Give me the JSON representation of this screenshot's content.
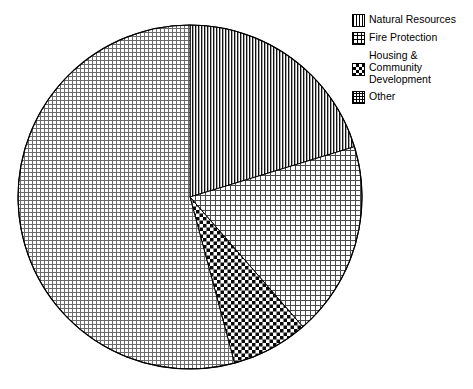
{
  "chart_data": {
    "type": "pie",
    "title": "",
    "labels": [
      "Natural Resources",
      "Fire Protection",
      "Housing & Community Development",
      "Other"
    ],
    "values": [
      20.3,
      18.3,
      7.1,
      54.3
    ],
    "units": "percent",
    "start_angle_deg": 0,
    "direction": "clockwise",
    "legend_position": "top-right",
    "grid": false,
    "slices": [
      {
        "label": "Natural Resources",
        "value": 20.3,
        "start_angle_deg": 0,
        "end_angle_deg": 73,
        "pattern": "vertical-stripes",
        "color": "#000000",
        "background": "#ffffff"
      },
      {
        "label": "Fire Protection",
        "value": 18.3,
        "start_angle_deg": 73,
        "end_angle_deg": 139,
        "pattern": "grid-coarse",
        "color": "#000000",
        "background": "#ffffff"
      },
      {
        "label": "Housing & Community Development",
        "value": 7.1,
        "start_angle_deg": 139,
        "end_angle_deg": 165,
        "pattern": "checkerboard",
        "color": "#000000",
        "background": "#ffffff"
      },
      {
        "label": "Other",
        "value": 54.3,
        "start_angle_deg": 165,
        "end_angle_deg": 360,
        "pattern": "grid-fine",
        "color": "#000000",
        "background": "#ffffff"
      }
    ]
  },
  "legend": {
    "items": [
      {
        "label": "Natural Resources",
        "swatch": "vertical-stripes-swatch",
        "multiline": false
      },
      {
        "label": "Fire Protection",
        "swatch": "grid-coarse-swatch",
        "multiline": false
      },
      {
        "label": "Housing &\nCommunity\nDevelopment",
        "swatch": "checkerboard-swatch",
        "multiline": true
      },
      {
        "label": "Other",
        "swatch": "grid-fine-swatch",
        "multiline": false
      }
    ]
  },
  "geometry": {
    "center_x": 190,
    "center_y": 197,
    "radius": 172
  }
}
